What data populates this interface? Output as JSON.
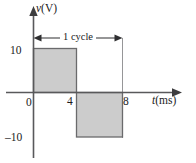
{
  "figure": {
    "name": "square-wave-voltage-waveform",
    "background_color": "#ffffff"
  },
  "axes": {
    "y_axis_label": "v (V)",
    "y_axis_symbol": "v",
    "y_axis_unit": "(V)",
    "x_axis_label": "t (ms)",
    "x_axis_symbol": "t",
    "x_axis_unit": "(ms)"
  },
  "ticks": {
    "y": [
      "10",
      "–10"
    ],
    "y_positive": "10",
    "y_negative": "–10",
    "x_origin": "0",
    "x_mid": "4",
    "x_end": "8"
  },
  "annotation": {
    "cycle_label": "1 cycle"
  },
  "colors": {
    "fill": "#cccccc",
    "stroke": "#6a6a6c",
    "axis": "#59595b",
    "text": "#1b1b1d",
    "annotation": "#2f2f31"
  },
  "chart_data": {
    "type": "line",
    "title": "",
    "subtitle": "",
    "xlabel": "t (ms)",
    "ylabel": "v (V)",
    "xlim": [
      0,
      9.5
    ],
    "ylim": [
      -13,
      13
    ],
    "xticks": [
      0,
      4,
      8
    ],
    "xticklabels": [
      "0",
      "4",
      "8"
    ],
    "yticks": [
      -10,
      10
    ],
    "yticklabels": [
      "–10",
      "10"
    ],
    "grid": false,
    "legend": null,
    "waveform": "square",
    "amplitude": 10,
    "period": 8,
    "period_unit": "ms",
    "frequency": 125,
    "frequency_unit": "Hz",
    "fill_under_curve": true,
    "series": [
      {
        "name": "v(t)",
        "x": [
          0,
          0,
          4,
          4,
          8,
          8
        ],
        "values": [
          0,
          10,
          10,
          -10,
          -10,
          0
        ]
      }
    ],
    "segments": [
      {
        "t_start": 0,
        "t_end": 4,
        "v": 10
      },
      {
        "t_start": 4,
        "t_end": 8,
        "v": -10
      }
    ],
    "annotations": [
      {
        "text": "1 cycle",
        "type": "span-arrow",
        "x_start": 0,
        "x_end": 8,
        "y": 13,
        "double_headed": true
      }
    ]
  }
}
